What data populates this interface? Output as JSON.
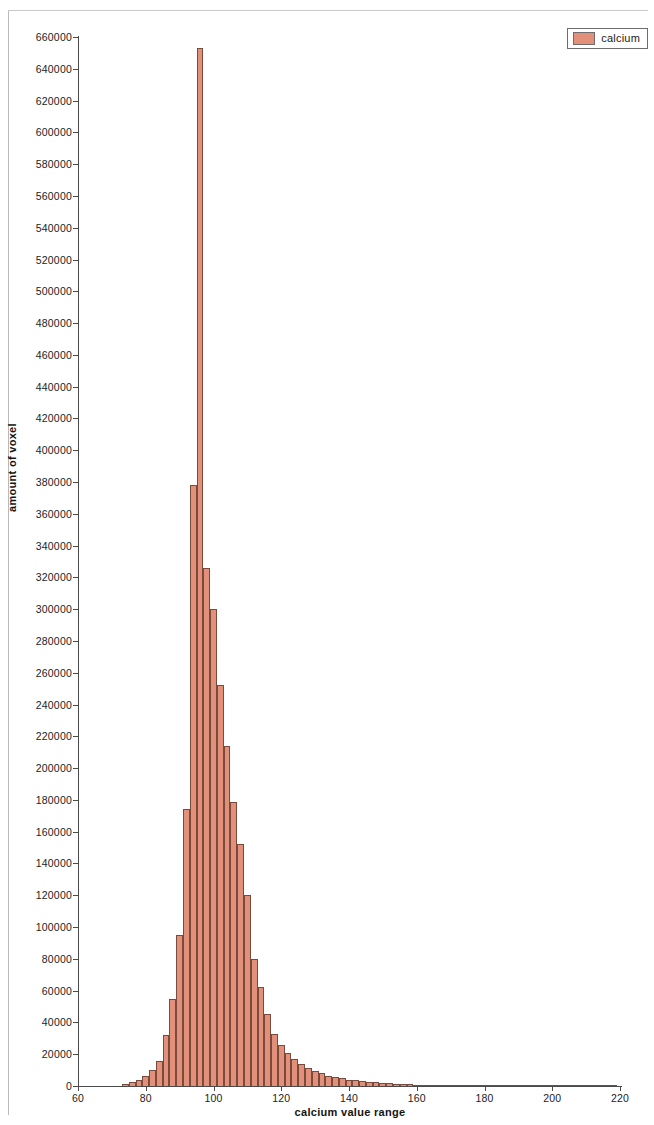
{
  "chart_data": {
    "type": "bar",
    "title": "",
    "xlabel": "calcium value range",
    "ylabel": "amount of voxel",
    "xlim": [
      60,
      220
    ],
    "ylim": [
      0,
      660000
    ],
    "grid": false,
    "legend_position": "top-right",
    "bin_width": 2,
    "series": [
      {
        "name": "calcium",
        "color": "#e2907a",
        "edge_color": "#7a4a3c",
        "x": [
          74,
          76,
          78,
          80,
          82,
          84,
          86,
          88,
          90,
          92,
          94,
          96,
          98,
          100,
          102,
          104,
          106,
          108,
          110,
          112,
          114,
          116,
          118,
          120,
          122,
          124,
          126,
          128,
          130,
          132,
          134,
          136,
          138,
          140,
          142,
          144,
          146,
          148,
          150,
          152,
          154,
          156,
          158,
          160,
          162,
          164,
          166,
          168,
          170,
          172,
          174,
          176,
          178,
          180,
          182,
          184,
          186,
          188,
          190,
          192,
          194,
          196,
          198,
          200,
          202,
          204,
          206,
          208,
          210,
          212,
          214,
          216,
          218
        ],
        "values": [
          1000,
          2500,
          3500,
          6000,
          10000,
          16000,
          32000,
          55000,
          95000,
          174000,
          378000,
          653000,
          326000,
          300000,
          252000,
          214000,
          179000,
          152000,
          120000,
          80000,
          62000,
          45000,
          33000,
          26000,
          21000,
          17000,
          14000,
          11500,
          9500,
          8000,
          6500,
          5500,
          4800,
          4000,
          3500,
          3000,
          2600,
          2300,
          2000,
          1800,
          1500,
          1300,
          1100,
          950,
          800,
          700,
          600,
          500,
          450,
          400,
          350,
          300,
          260,
          230,
          200,
          180,
          160,
          140,
          120,
          110,
          100,
          90,
          80,
          70,
          65,
          60,
          55,
          50,
          45,
          40,
          35,
          30,
          25
        ]
      }
    ],
    "x_ticks": [
      60,
      80,
      100,
      120,
      140,
      160,
      180,
      200,
      220
    ],
    "y_ticks": [
      0,
      20000,
      40000,
      60000,
      80000,
      100000,
      120000,
      140000,
      160000,
      180000,
      200000,
      220000,
      240000,
      260000,
      280000,
      300000,
      320000,
      340000,
      360000,
      380000,
      400000,
      420000,
      440000,
      460000,
      480000,
      500000,
      520000,
      540000,
      560000,
      580000,
      600000,
      620000,
      640000,
      660000
    ]
  },
  "legend": {
    "entries": [
      {
        "label": "calcium",
        "color": "#e2907a"
      }
    ]
  }
}
